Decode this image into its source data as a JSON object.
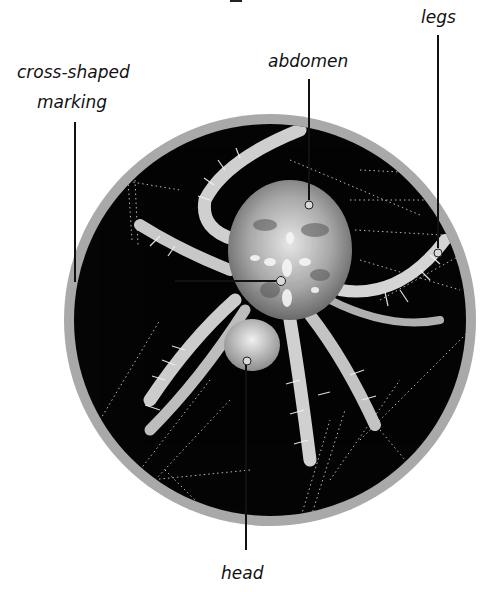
{
  "diagram": {
    "labels": {
      "cross_marking_line1": "cross-shaped",
      "cross_marking_line2": "marking",
      "abdomen": "abdomen",
      "legs": "legs",
      "head": "head"
    },
    "colors": {
      "ring": "#a9a9a9",
      "photo_background": "#050505",
      "leader_line": "#111111",
      "label_text": "#111111"
    }
  }
}
